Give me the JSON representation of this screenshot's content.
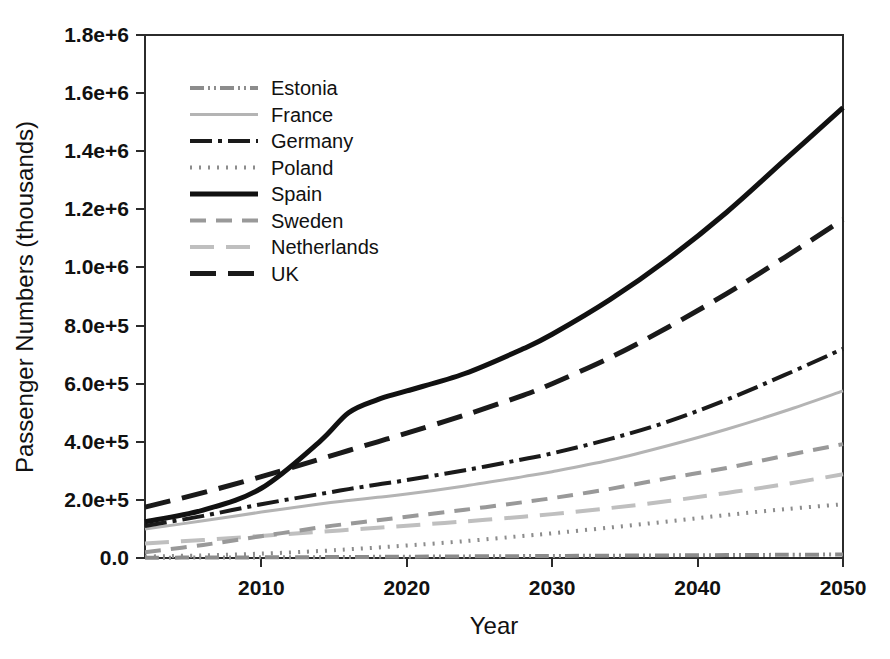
{
  "chart_data": {
    "type": "line",
    "title": "",
    "xlabel": "Year",
    "ylabel": "Passenger Numbers (thousands)",
    "xlim": [
      2002,
      2050
    ],
    "ylim": [
      0,
      1800000
    ],
    "grid": false,
    "legend_position": "top-left-inside",
    "x_tick_labels": [
      "2010",
      "2020",
      "2030",
      "2040",
      "2050"
    ],
    "x_tick_values": [
      2010,
      2020,
      2030,
      2040,
      2050
    ],
    "y_tick_labels": [
      "0.0",
      "2.0e+5",
      "4.0e+5",
      "6.0e+5",
      "8.0e+5",
      "1.0e+6",
      "1.2e+6",
      "1.4e+6",
      "1.6e+6",
      "1.8e+6"
    ],
    "y_tick_values": [
      0,
      200000,
      400000,
      600000,
      800000,
      1000000,
      1200000,
      1400000,
      1600000,
      1800000
    ],
    "x": [
      2002,
      2006,
      2010,
      2014,
      2016,
      2018,
      2020,
      2024,
      2028,
      2030,
      2034,
      2038,
      2042,
      2046,
      2050
    ],
    "series": [
      {
        "name": "Estonia",
        "color": "#8c8c8c",
        "dash": "14,4,2,4,2,4",
        "width": 4,
        "values": [
          1000,
          1500,
          2200,
          3000,
          3500,
          4000,
          4500,
          5500,
          6500,
          7000,
          8000,
          9000,
          10000,
          11000,
          12000
        ]
      },
      {
        "name": "France",
        "color": "#b4b4b4",
        "dash": "",
        "width": 3,
        "values": [
          100000,
          128000,
          158000,
          186000,
          198000,
          209000,
          220000,
          248000,
          280000,
          297000,
          337000,
          387000,
          443000,
          506000,
          575000
        ]
      },
      {
        "name": "Germany",
        "color": "#1a1a1a",
        "dash": "22,6,4,6",
        "width": 4,
        "values": [
          110000,
          145000,
          185000,
          220000,
          237000,
          253000,
          268000,
          302000,
          340000,
          360000,
          410000,
          470000,
          545000,
          630000,
          720000
        ]
      },
      {
        "name": "Poland",
        "color": "#8c8c8c",
        "dash": "2,7",
        "width": 4,
        "values": [
          5000,
          9000,
          15000,
          24000,
          30000,
          36000,
          43000,
          58000,
          76000,
          85000,
          105000,
          126000,
          148000,
          168000,
          185000
        ]
      },
      {
        "name": "Spain",
        "color": "#111111",
        "dash": "",
        "width": 5,
        "values": [
          125000,
          165000,
          240000,
          400000,
          500000,
          545000,
          575000,
          635000,
          720000,
          770000,
          890000,
          1030000,
          1190000,
          1370000,
          1550000
        ]
      },
      {
        "name": "Sweden",
        "color": "#999999",
        "dash": "16,10",
        "width": 4,
        "values": [
          20000,
          45000,
          75000,
          105000,
          118000,
          130000,
          142000,
          166000,
          192000,
          206000,
          238000,
          275000,
          310000,
          352000,
          392000
        ]
      },
      {
        "name": "Netherlands",
        "color": "#bfbfbf",
        "dash": "24,12",
        "width": 4,
        "values": [
          50000,
          62000,
          76000,
          90000,
          97000,
          104000,
          111000,
          126000,
          142000,
          151000,
          172000,
          196000,
          224000,
          254000,
          288000
        ]
      },
      {
        "name": "UK",
        "color": "#1a1a1a",
        "dash": "26,12",
        "width": 5,
        "values": [
          175000,
          225000,
          280000,
          340000,
          370000,
          400000,
          430000,
          492000,
          560000,
          600000,
          690000,
          795000,
          910000,
          1035000,
          1165000
        ]
      }
    ]
  },
  "axes": {
    "y_title": "Passenger Numbers (thousands)",
    "x_title": "Year"
  },
  "legend": {
    "entries": [
      {
        "label": "Estonia"
      },
      {
        "label": "France"
      },
      {
        "label": "Germany"
      },
      {
        "label": "Poland"
      },
      {
        "label": "Spain"
      },
      {
        "label": "Sweden"
      },
      {
        "label": "Netherlands"
      },
      {
        "label": "UK"
      }
    ]
  }
}
